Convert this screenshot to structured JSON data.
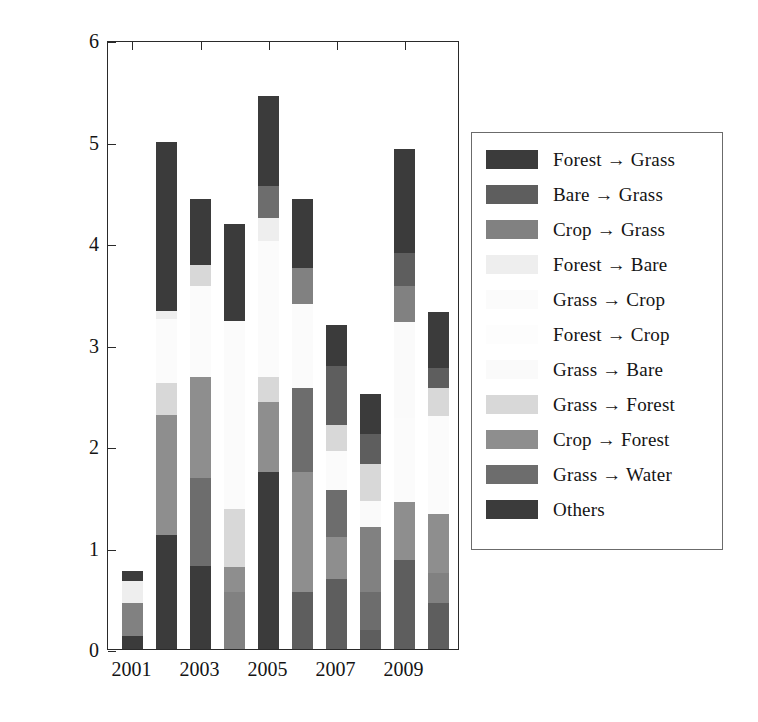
{
  "axes": {
    "ylabel_text": "Annual land-cover change (km",
    "ylabel_sup": "2",
    "ylabel_tail": ")",
    "ytick_labels": [
      "0",
      "1",
      "2",
      "3",
      "4",
      "5",
      "6"
    ],
    "xtick_labels": [
      "2001",
      "2003",
      "2005",
      "2007",
      "2009"
    ]
  },
  "legend": {
    "items": [
      {
        "label": "Forest → Grass",
        "color": "#3b3b3b"
      },
      {
        "label": "Bare → Grass",
        "color": "#5e5e5e"
      },
      {
        "label": "Crop → Grass",
        "color": "#818181"
      },
      {
        "label": "Forest → Bare",
        "color": "#eeeeee"
      },
      {
        "label": "Grass → Crop",
        "color": "#fbfbfb"
      },
      {
        "label": "Forest → Crop",
        "color": "#fdfdfd"
      },
      {
        "label": "Grass → Bare",
        "color": "#fafafa"
      },
      {
        "label": "Grass → Forest",
        "color": "#d8d8d8"
      },
      {
        "label": "Crop → Forest",
        "color": "#8e8e8e"
      },
      {
        "label": "Grass → Water",
        "color": "#6d6d6d"
      },
      {
        "label": "Others",
        "color": "#3b3b3b"
      }
    ]
  },
  "chart_data": {
    "type": "bar",
    "title": "",
    "xlabel": "",
    "ylabel": "Annual land-cover change (km2)",
    "ylim": [
      0,
      6
    ],
    "stacked": true,
    "grid": false,
    "legend_position": "right",
    "categories": [
      "2001",
      "2002",
      "2003",
      "2004",
      "2005",
      "2006",
      "2007",
      "2008",
      "2009",
      "2010"
    ],
    "series": [
      {
        "name": "Forest → Grass",
        "color": "#3b3b3b",
        "values": [
          0.13,
          1.12,
          0.82,
          0.0,
          1.74,
          0.0,
          0.0,
          0.0,
          0.0,
          0.0
        ]
      },
      {
        "name": "Bare → Grass",
        "color": "#5e5e5e",
        "values": [
          0.0,
          0.0,
          0.0,
          0.0,
          0.0,
          0.56,
          0.69,
          0.19,
          0.88,
          0.45
        ]
      },
      {
        "name": "Crop → Grass",
        "color": "#818181",
        "values": [
          0.32,
          0.0,
          0.0,
          0.56,
          0.0,
          0.0,
          0.0,
          0.0,
          0.0,
          0.3
        ]
      },
      {
        "name": "Forest → Bare",
        "color": "#eeeeee",
        "values": [
          0.22,
          0.0,
          0.0,
          0.0,
          0.0,
          0.0,
          0.0,
          0.0,
          0.0,
          0.0
        ]
      },
      {
        "name": "Grass → Crop",
        "color": "#fbfbfb",
        "values": [
          0.0,
          0.0,
          0.0,
          0.0,
          0.0,
          0.0,
          0.0,
          0.0,
          0.0,
          0.0
        ]
      },
      {
        "name": "Forest → Crop",
        "color": "#fdfdfd",
        "values": [
          0.0,
          0.0,
          0.0,
          0.0,
          0.0,
          0.0,
          0.0,
          0.0,
          0.0,
          0.0
        ]
      },
      {
        "name": "Grass → Bare",
        "color": "#fafafa",
        "values": [
          0.0,
          0.0,
          0.0,
          0.0,
          0.0,
          0.0,
          0.0,
          0.26,
          0.0,
          0.0
        ]
      },
      {
        "name": "Grass → Forest",
        "color": "#d8d8d8",
        "values": [
          0.0,
          0.0,
          0.0,
          0.0,
          0.0,
          0.0,
          0.0,
          0.62,
          0.0,
          0.0
        ]
      },
      {
        "name": "Crop → Forest",
        "color": "#8e8e8e",
        "values": [
          0.0,
          1.19,
          0.85,
          0.25,
          0.69,
          1.18,
          0.41,
          0.0,
          0.57,
          0.58
        ]
      },
      {
        "name": "Grass → Water",
        "color": "#6d6d6d",
        "values": [
          0.0,
          0.0,
          1.02,
          0.0,
          0.0,
          0.83,
          0.47,
          0.37,
          0.0,
          0.0
        ]
      },
      {
        "name": "Others",
        "color": "#3b3b3b",
        "values": [
          0.1,
          1.67,
          0.65,
          0.96,
          1.0,
          0.68,
          0.4,
          0.39,
          1.04,
          0.55
        ]
      }
    ],
    "bar_totals": [
      0.77,
      5.0,
      4.43,
      4.19,
      5.45,
      4.43,
      3.19,
      2.51,
      4.93,
      3.32
    ],
    "stacks": [
      {
        "year": "2001",
        "segments": [
          {
            "cat": "Forest → Grass",
            "color": "#3b3b3b",
            "from": 0.0,
            "to": 0.13
          },
          {
            "cat": "Crop → Grass",
            "color": "#818181",
            "from": 0.13,
            "to": 0.45
          },
          {
            "cat": "Forest → Bare",
            "color": "#eeeeee",
            "from": 0.45,
            "to": 0.67
          },
          {
            "cat": "Others",
            "color": "#3b3b3b",
            "from": 0.67,
            "to": 0.77
          }
        ]
      },
      {
        "year": "2002",
        "segments": [
          {
            "cat": "Forest → Grass",
            "color": "#3b3b3b",
            "from": 0.0,
            "to": 1.12
          },
          {
            "cat": "Crop → Forest",
            "color": "#8e8e8e",
            "from": 1.12,
            "to": 2.31
          },
          {
            "cat": "Grass → Forest",
            "color": "#d8d8d8",
            "from": 2.31,
            "to": 2.62
          },
          {
            "cat": "Grass → Crop",
            "color": "#fbfbfb",
            "from": 2.62,
            "to": 3.25
          },
          {
            "cat": "Forest → Bare",
            "color": "#eeeeee",
            "from": 3.25,
            "to": 3.33
          },
          {
            "cat": "Others",
            "color": "#3b3b3b",
            "from": 3.33,
            "to": 5.0
          }
        ]
      },
      {
        "year": "2003",
        "segments": [
          {
            "cat": "Forest → Grass",
            "color": "#3b3b3b",
            "from": 0.0,
            "to": 0.82
          },
          {
            "cat": "Grass → Water",
            "color": "#6d6d6d",
            "from": 0.82,
            "to": 1.68
          },
          {
            "cat": "Crop → Forest",
            "color": "#8e8e8e",
            "from": 1.68,
            "to": 2.68
          },
          {
            "cat": "Grass → Crop",
            "color": "#fbfbfb",
            "from": 2.68,
            "to": 3.58
          },
          {
            "cat": "Grass → Forest",
            "color": "#d8d8d8",
            "from": 3.58,
            "to": 3.78
          },
          {
            "cat": "Others",
            "color": "#3b3b3b",
            "from": 3.78,
            "to": 4.43
          }
        ]
      },
      {
        "year": "2004",
        "segments": [
          {
            "cat": "Crop → Grass",
            "color": "#818181",
            "from": 0.0,
            "to": 0.56
          },
          {
            "cat": "Crop → Forest",
            "color": "#8e8e8e",
            "from": 0.56,
            "to": 0.81
          },
          {
            "cat": "Grass → Forest",
            "color": "#d8d8d8",
            "from": 0.81,
            "to": 1.38
          },
          {
            "cat": "Grass → Crop",
            "color": "#fbfbfb",
            "from": 1.38,
            "to": 3.23
          },
          {
            "cat": "Others",
            "color": "#3b3b3b",
            "from": 3.23,
            "to": 4.19
          }
        ]
      },
      {
        "year": "2005",
        "segments": [
          {
            "cat": "Forest → Grass",
            "color": "#3b3b3b",
            "from": 0.0,
            "to": 1.74
          },
          {
            "cat": "Crop → Forest",
            "color": "#8e8e8e",
            "from": 1.74,
            "to": 2.43
          },
          {
            "cat": "Grass → Forest",
            "color": "#d8d8d8",
            "from": 2.43,
            "to": 2.68
          },
          {
            "cat": "Grass → Crop",
            "color": "#fbfbfb",
            "from": 2.68,
            "to": 4.02
          },
          {
            "cat": "Forest → Bare",
            "color": "#eeeeee",
            "from": 4.02,
            "to": 4.25
          },
          {
            "cat": "Grass → Water",
            "color": "#6d6d6d",
            "from": 4.25,
            "to": 4.56
          },
          {
            "cat": "Others",
            "color": "#3b3b3b",
            "from": 4.56,
            "to": 5.45
          }
        ]
      },
      {
        "year": "2006",
        "segments": [
          {
            "cat": "Bare → Grass",
            "color": "#5e5e5e",
            "from": 0.0,
            "to": 0.56
          },
          {
            "cat": "Crop → Forest",
            "color": "#8e8e8e",
            "from": 0.56,
            "to": 1.74
          },
          {
            "cat": "Grass → Water",
            "color": "#6d6d6d",
            "from": 1.74,
            "to": 2.57
          },
          {
            "cat": "Grass → Crop",
            "color": "#fbfbfb",
            "from": 2.57,
            "to": 3.4
          },
          {
            "cat": "Crop → Grass",
            "color": "#818181",
            "from": 3.4,
            "to": 3.75
          },
          {
            "cat": "Others",
            "color": "#3b3b3b",
            "from": 3.75,
            "to": 4.43
          }
        ]
      },
      {
        "year": "2007",
        "segments": [
          {
            "cat": "Bare → Grass",
            "color": "#5e5e5e",
            "from": 0.0,
            "to": 0.69
          },
          {
            "cat": "Crop → Forest",
            "color": "#8e8e8e",
            "from": 0.69,
            "to": 1.1
          },
          {
            "cat": "Grass → Water",
            "color": "#6d6d6d",
            "from": 1.1,
            "to": 1.57
          },
          {
            "cat": "Grass → Crop",
            "color": "#fbfbfb",
            "from": 1.57,
            "to": 1.95
          },
          {
            "cat": "Grass → Forest",
            "color": "#d8d8d8",
            "from": 1.95,
            "to": 2.21
          },
          {
            "cat": "Bare → Grass",
            "color": "#5e5e5e",
            "from": 2.21,
            "to": 2.79
          },
          {
            "cat": "Others",
            "color": "#3b3b3b",
            "from": 2.79,
            "to": 3.19
          }
        ]
      },
      {
        "year": "2008",
        "segments": [
          {
            "cat": "Bare → Grass",
            "color": "#5e5e5e",
            "from": 0.0,
            "to": 0.19
          },
          {
            "cat": "Grass → Water",
            "color": "#6d6d6d",
            "from": 0.19,
            "to": 0.56
          },
          {
            "cat": "Crop → Grass",
            "color": "#818181",
            "from": 0.56,
            "to": 1.2
          },
          {
            "cat": "Grass → Bare",
            "color": "#fafafa",
            "from": 1.2,
            "to": 1.46
          },
          {
            "cat": "Grass → Forest",
            "color": "#d8d8d8",
            "from": 1.46,
            "to": 1.82
          },
          {
            "cat": "Bare → Grass",
            "color": "#5e5e5e",
            "from": 1.82,
            "to": 2.12
          },
          {
            "cat": "Others",
            "color": "#3b3b3b",
            "from": 2.12,
            "to": 2.51
          }
        ]
      },
      {
        "year": "2009",
        "segments": [
          {
            "cat": "Bare → Grass",
            "color": "#5e5e5e",
            "from": 0.0,
            "to": 0.88
          },
          {
            "cat": "Crop → Forest",
            "color": "#8e8e8e",
            "from": 0.88,
            "to": 1.45
          },
          {
            "cat": "Grass → Crop",
            "color": "#fbfbfb",
            "from": 1.45,
            "to": 2.28
          },
          {
            "cat": "Grass → Bare",
            "color": "#fafafa",
            "from": 2.28,
            "to": 3.22
          },
          {
            "cat": "Crop → Grass",
            "color": "#818181",
            "from": 3.22,
            "to": 3.58
          },
          {
            "cat": "Bare → Grass",
            "color": "#5e5e5e",
            "from": 3.58,
            "to": 3.9
          },
          {
            "cat": "Others",
            "color": "#3b3b3b",
            "from": 3.9,
            "to": 4.93
          }
        ]
      },
      {
        "year": "2010",
        "segments": [
          {
            "cat": "Bare → Grass",
            "color": "#5e5e5e",
            "from": 0.0,
            "to": 0.45
          },
          {
            "cat": "Crop → Grass",
            "color": "#818181",
            "from": 0.45,
            "to": 0.75
          },
          {
            "cat": "Crop → Forest",
            "color": "#8e8e8e",
            "from": 0.75,
            "to": 1.33
          },
          {
            "cat": "Grass → Crop",
            "color": "#fbfbfb",
            "from": 1.33,
            "to": 2.3
          },
          {
            "cat": "Grass → Forest",
            "color": "#d8d8d8",
            "from": 2.3,
            "to": 2.57
          },
          {
            "cat": "Bare → Grass",
            "color": "#5e5e5e",
            "from": 2.57,
            "to": 2.77
          },
          {
            "cat": "Others",
            "color": "#3b3b3b",
            "from": 2.77,
            "to": 3.32
          }
        ]
      }
    ]
  }
}
